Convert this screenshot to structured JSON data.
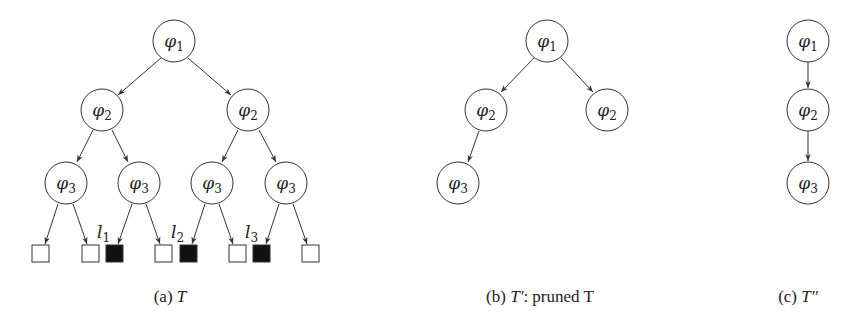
{
  "figure": {
    "panels": [
      {
        "id": "a",
        "caption": {
          "prefix": "(a) ",
          "title": "T",
          "suffix": ""
        },
        "nodes": [
          {
            "id": "a1",
            "label": "φ",
            "sub": "1",
            "x": 174,
            "y": 41
          },
          {
            "id": "a2",
            "label": "φ",
            "sub": "2",
            "x": 102,
            "y": 110
          },
          {
            "id": "a3",
            "label": "φ",
            "sub": "2",
            "x": 248,
            "y": 110
          },
          {
            "id": "a4",
            "label": "φ",
            "sub": "3",
            "x": 66,
            "y": 183
          },
          {
            "id": "a5",
            "label": "φ",
            "sub": "3",
            "x": 139,
            "y": 183
          },
          {
            "id": "a6",
            "label": "φ",
            "sub": "3",
            "x": 212,
            "y": 183
          },
          {
            "id": "a7",
            "label": "φ",
            "sub": "3",
            "x": 286,
            "y": 183
          }
        ],
        "leaves": [
          {
            "x": 41,
            "filled": false
          },
          {
            "x": 90,
            "filled": false
          },
          {
            "x": 114,
            "filled": true,
            "label": "l",
            "sub": "1"
          },
          {
            "x": 163,
            "filled": false
          },
          {
            "x": 188,
            "filled": true,
            "label": "l",
            "sub": "2"
          },
          {
            "x": 237,
            "filled": false
          },
          {
            "x": 261,
            "filled": true,
            "label": "l",
            "sub": "3"
          },
          {
            "x": 311,
            "filled": false
          }
        ]
      },
      {
        "id": "b",
        "caption": {
          "prefix": "(b) ",
          "title": "T′",
          "suffix": ": pruned T"
        },
        "nodes": [
          {
            "id": "b1",
            "label": "φ",
            "sub": "1",
            "x": 547,
            "y": 41
          },
          {
            "id": "b2",
            "label": "φ",
            "sub": "2",
            "x": 486,
            "y": 110
          },
          {
            "id": "b3",
            "label": "φ",
            "sub": "2",
            "x": 607,
            "y": 110
          },
          {
            "id": "b4",
            "label": "φ",
            "sub": "3",
            "x": 458,
            "y": 183
          }
        ]
      },
      {
        "id": "c",
        "caption": {
          "prefix": "(c) ",
          "title": "T″",
          "suffix": ""
        },
        "nodes": [
          {
            "id": "c1",
            "label": "φ",
            "sub": "1",
            "x": 808,
            "y": 41
          },
          {
            "id": "c2",
            "label": "φ",
            "sub": "2",
            "x": 808,
            "y": 110
          },
          {
            "id": "c3",
            "label": "φ",
            "sub": "3",
            "x": 808,
            "y": 183
          }
        ]
      }
    ],
    "colors": {
      "stroke": "#333333",
      "leaf_filled": "#111111",
      "leaf_empty": "#ffffff",
      "background": "#ffffff"
    }
  }
}
